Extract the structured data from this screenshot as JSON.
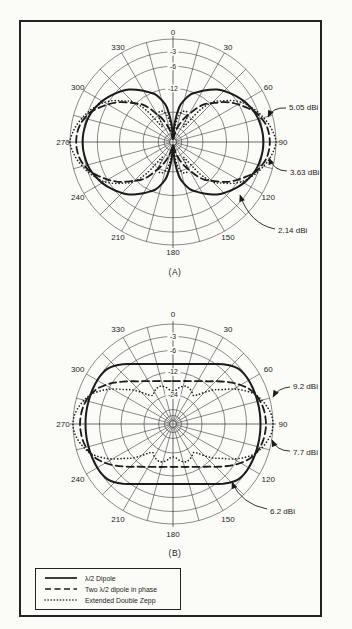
{
  "figure": {
    "ink": "#1b1b1b",
    "paper": "#fbfbf8",
    "grid_color": "#2b2b2b"
  },
  "legend": {
    "items": [
      {
        "style": "solid",
        "label": "λ/2 Dipole"
      },
      {
        "style": "dashed",
        "label": "Two λ/2 dipole in phase"
      },
      {
        "style": "dotted",
        "label": "Extended Double Zepp"
      }
    ]
  },
  "chart_data": [
    {
      "type": "polar",
      "panel_label": "(A)",
      "angle_tick_labels_deg": [
        0,
        30,
        60,
        90,
        120,
        150,
        180,
        210,
        240,
        270,
        300,
        330
      ],
      "angle_grid_step_deg": 15,
      "radial_ring_fractions": [
        1,
        0.875,
        0.735,
        0.52,
        0.29,
        0.145,
        0.085,
        0.035
      ],
      "ring_db_labels": [
        {
          "text": "-3",
          "fraction": 0.875
        },
        {
          "text": "-6",
          "fraction": 0.735
        },
        {
          "text": "-12",
          "fraction": 0.52
        }
      ],
      "series": [
        {
          "name": "λ/2 Dipole",
          "line": "solid",
          "gain_dbi": 2.14,
          "r_fraction_step5deg_0_to_90": [
            0.03,
            0.18,
            0.34,
            0.42,
            0.49,
            0.53,
            0.575,
            0.62,
            0.665,
            0.7,
            0.732,
            0.765,
            0.795,
            0.82,
            0.843,
            0.858,
            0.868,
            0.875,
            0.878
          ]
        },
        {
          "name": "Two λ/2 dipole in phase",
          "line": "dashed",
          "gain_dbi": 3.63,
          "r_fraction_step5deg_0_to_90": [
            0.03,
            0.03,
            0.06,
            0.12,
            0.18,
            0.25,
            0.31,
            0.4,
            0.48,
            0.53,
            0.6,
            0.67,
            0.73,
            0.79,
            0.85,
            0.89,
            0.92,
            0.935,
            0.94
          ]
        },
        {
          "name": "Extended Double Zepp",
          "line": "dotted",
          "gain_dbi": 5.05,
          "r_fraction_step5deg_0_to_90": [
            0.04,
            0.1,
            0.22,
            0.29,
            0.32,
            0.32,
            0.27,
            0.18,
            0.4,
            0.55,
            0.62,
            0.7,
            0.77,
            0.82,
            0.87,
            0.91,
            0.95,
            0.98,
            1.0
          ]
        }
      ],
      "callouts": [
        {
          "label": "5.05 dBi",
          "text_xy": [
            289,
            107
          ],
          "leader": "M286,108 Q273,107 268,117"
        },
        {
          "label": "3.63 dBi",
          "text_xy": [
            290,
            172
          ],
          "leader": "M287,171 Q274,171 269,158"
        },
        {
          "label": "2.14 dBi",
          "text_xy": [
            278,
            230
          ],
          "leader": "M275,229 Q250,224 240,195"
        }
      ],
      "geometry": {
        "cx": 173,
        "cy": 142,
        "R": 103,
        "labelR": 110
      }
    },
    {
      "type": "polar",
      "panel_label": "(B)",
      "angle_tick_labels_deg": [
        0,
        30,
        60,
        90,
        120,
        150,
        180,
        210,
        240,
        270,
        300,
        330
      ],
      "angle_grid_step_deg": 15,
      "radial_ring_fractions": [
        1,
        0.875,
        0.735,
        0.52,
        0.29,
        0.145,
        0.085,
        0.035
      ],
      "ring_db_labels": [
        {
          "text": "-3",
          "fraction": 0.875
        },
        {
          "text": "-6",
          "fraction": 0.735
        },
        {
          "text": "-12",
          "fraction": 0.52
        },
        {
          "text": "-24",
          "fraction": 0.29
        }
      ],
      "series": [
        {
          "name": "λ/2 Dipole",
          "line": "solid",
          "gain_dbi": 6.2,
          "r_fraction_step5deg_0_to_90": [
            0.6,
            0.602,
            0.609,
            0.621,
            0.638,
            0.662,
            0.693,
            0.732,
            0.78,
            0.825,
            0.857,
            0.87,
            0.874,
            0.875,
            0.875,
            0.875,
            0.875,
            0.875,
            0.875
          ]
        },
        {
          "name": "Two λ/2 dipole in phase",
          "line": "dashed",
          "gain_dbi": 7.7,
          "r_fraction_step5deg_0_to_90": [
            0.43,
            0.431,
            0.436,
            0.445,
            0.457,
            0.473,
            0.494,
            0.522,
            0.558,
            0.605,
            0.66,
            0.72,
            0.78,
            0.835,
            0.875,
            0.9,
            0.917,
            0.926,
            0.93
          ]
        },
        {
          "name": "Extended Double Zepp",
          "line": "dotted",
          "gain_dbi": 9.2,
          "r_fraction_step5deg_0_to_90": [
            0.33,
            0.34,
            0.37,
            0.39,
            0.4,
            0.39,
            0.375,
            0.35,
            0.38,
            0.45,
            0.53,
            0.6,
            0.7,
            0.79,
            0.87,
            0.92,
            0.96,
            0.99,
            1.0
          ]
        }
      ],
      "callouts": [
        {
          "label": "9.2 dBi",
          "text_xy": [
            293,
            386
          ],
          "leader": "M290,387 Q278,388 273,397"
        },
        {
          "label": "7.7 dBi",
          "text_xy": [
            293,
            452
          ],
          "leader": "M290,451 Q277,451 272,440"
        },
        {
          "label": "6.2 dBi",
          "text_xy": [
            270,
            511
          ],
          "leader": "M267,509 Q241,504 232,482"
        }
      ],
      "geometry": {
        "cx": 173,
        "cy": 424,
        "R": 100,
        "labelR": 110
      }
    }
  ]
}
